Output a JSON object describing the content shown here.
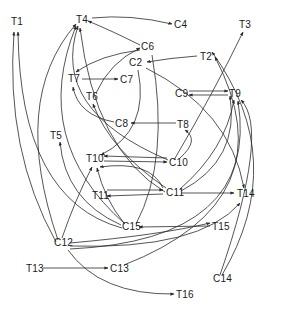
{
  "diagram": {
    "type": "directed-graph",
    "ink_color": "#2a2a2a",
    "background": "#ffffff",
    "nodes": [
      {
        "id": "T1",
        "label": "T1",
        "x": 17,
        "y": 25
      },
      {
        "id": "T4",
        "label": "T4",
        "x": 81,
        "y": 23
      },
      {
        "id": "C4",
        "label": "C4",
        "x": 180,
        "y": 27
      },
      {
        "id": "T3",
        "label": "T3",
        "x": 245,
        "y": 28
      },
      {
        "id": "C6",
        "label": "C6",
        "x": 147,
        "y": 50
      },
      {
        "id": "C2",
        "label": "C2",
        "x": 138,
        "y": 65
      },
      {
        "id": "T2",
        "label": "T2",
        "x": 207,
        "y": 59
      },
      {
        "id": "T7",
        "label": "T7",
        "x": 74,
        "y": 81
      },
      {
        "id": "C7",
        "label": "C7",
        "x": 123,
        "y": 82
      },
      {
        "id": "T6",
        "label": "T6",
        "x": 92,
        "y": 99
      },
      {
        "id": "C9",
        "label": "C9",
        "x": 181,
        "y": 96
      },
      {
        "id": "T9",
        "label": "T9",
        "x": 236,
        "y": 96
      },
      {
        "id": "C8",
        "label": "C8",
        "x": 122,
        "y": 126
      },
      {
        "id": "T8",
        "label": "T8",
        "x": 183,
        "y": 127
      },
      {
        "id": "T5",
        "label": "T5",
        "x": 56,
        "y": 138
      },
      {
        "id": "T10",
        "label": "T10",
        "x": 94,
        "y": 161
      },
      {
        "id": "C10",
        "label": "C10",
        "x": 176,
        "y": 165
      },
      {
        "id": "T11",
        "label": "T11",
        "x": 98,
        "y": 198
      },
      {
        "id": "C11",
        "label": "C11",
        "x": 172,
        "y": 195
      },
      {
        "id": "T14",
        "label": "T14",
        "x": 243,
        "y": 196
      },
      {
        "id": "C15",
        "label": "C15",
        "x": 130,
        "y": 229
      },
      {
        "id": "T15",
        "label": "T15",
        "x": 218,
        "y": 229
      },
      {
        "id": "C12",
        "label": "C12",
        "x": 62,
        "y": 245
      },
      {
        "id": "T13",
        "label": "T13",
        "x": 34,
        "y": 271
      },
      {
        "id": "C13",
        "label": "C13",
        "x": 117,
        "y": 270
      },
      {
        "id": "C14",
        "label": "C14",
        "x": 219,
        "y": 281
      },
      {
        "id": "T16",
        "label": "T16",
        "x": 183,
        "y": 297
      }
    ],
    "edges": [
      {
        "from": "C6",
        "to": "T4"
      },
      {
        "from": "T4",
        "to": "C4"
      },
      {
        "from": "C6",
        "to": "T7"
      },
      {
        "from": "T7",
        "to": "C7"
      },
      {
        "from": "T6",
        "to": "C6"
      },
      {
        "from": "T2",
        "to": "C2"
      },
      {
        "from": "C9",
        "to": "T9"
      },
      {
        "from": "T9",
        "to": "C9"
      },
      {
        "from": "T8",
        "to": "C8"
      },
      {
        "from": "C10",
        "to": "T10"
      },
      {
        "from": "T10",
        "to": "C10"
      },
      {
        "from": "C11",
        "to": "T11"
      },
      {
        "from": "T11",
        "to": "C11"
      },
      {
        "from": "C11",
        "to": "T14"
      },
      {
        "from": "T15",
        "to": "C15"
      },
      {
        "from": "T13",
        "to": "C13"
      },
      {
        "from": "C12",
        "to": "T16"
      },
      {
        "from": "C10",
        "to": "T3"
      },
      {
        "from": "C11",
        "to": "T9"
      },
      {
        "from": "C10",
        "to": "T8"
      },
      {
        "from": "C11",
        "to": "T4"
      },
      {
        "from": "C15",
        "to": "T1"
      },
      {
        "from": "C12",
        "to": "T1"
      },
      {
        "from": "C12",
        "to": "T10"
      },
      {
        "from": "C15",
        "to": "T10"
      },
      {
        "from": "C15",
        "to": "T5"
      },
      {
        "from": "C11",
        "to": "T10"
      },
      {
        "from": "C2",
        "to": "T10"
      },
      {
        "from": "C12",
        "to": "T15"
      },
      {
        "from": "C12",
        "to": "T14"
      },
      {
        "from": "C14",
        "to": "T2"
      },
      {
        "from": "C14",
        "to": "T9"
      },
      {
        "from": "C2",
        "to": "T14"
      },
      {
        "from": "C11",
        "to": "T6"
      },
      {
        "from": "C8",
        "to": "T7"
      },
      {
        "from": "C10",
        "to": "T4"
      },
      {
        "from": "C13",
        "to": "T2"
      },
      {
        "from": "C12",
        "to": "T9"
      },
      {
        "from": "C11",
        "to": "T2"
      }
    ]
  }
}
